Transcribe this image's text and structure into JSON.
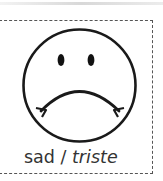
{
  "card": {
    "icon": "sad-face-icon",
    "caption": {
      "english": "sad",
      "separator": " / ",
      "translation": "triste"
    }
  },
  "colors": {
    "stroke": "#1a1a1a",
    "text": "#333333",
    "border": "#555555",
    "background": "#ffffff"
  }
}
